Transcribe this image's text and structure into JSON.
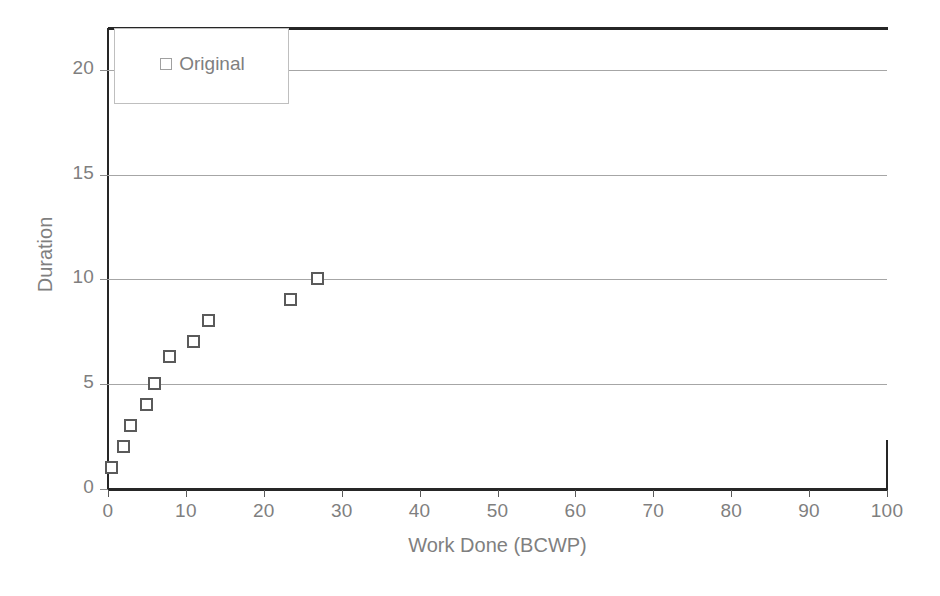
{
  "chart_data": {
    "type": "scatter",
    "title": "",
    "xlabel": "Work Done (BCWP)",
    "ylabel": "Duration",
    "xlim": [
      0,
      100
    ],
    "ylim": [
      0,
      22
    ],
    "xticks": [
      0,
      10,
      20,
      30,
      40,
      50,
      60,
      70,
      80,
      90,
      100
    ],
    "yticks": [
      0,
      5,
      10,
      15,
      20
    ],
    "grid": "horizontal",
    "legend_position": "top-left",
    "series": [
      {
        "name": "Original",
        "marker": "open-square",
        "marker_color": "#5a5a5a",
        "points": [
          {
            "x": 0.5,
            "y": 1
          },
          {
            "x": 2,
            "y": 2
          },
          {
            "x": 3,
            "y": 3
          },
          {
            "x": 5,
            "y": 4
          },
          {
            "x": 6,
            "y": 5
          },
          {
            "x": 8,
            "y": 6.3
          },
          {
            "x": 11,
            "y": 7
          },
          {
            "x": 13,
            "y": 8
          },
          {
            "x": 23.5,
            "y": 9
          },
          {
            "x": 27,
            "y": 10
          }
        ]
      }
    ]
  },
  "axes": {
    "x_title": "Work Done (BCWP)",
    "y_title": "Duration",
    "x_tick_labels": [
      "0",
      "10",
      "20",
      "30",
      "40",
      "50",
      "60",
      "70",
      "80",
      "90",
      "100"
    ],
    "y_tick_labels": [
      "0",
      "5",
      "10",
      "15",
      "20"
    ]
  },
  "legend": {
    "entries": [
      {
        "label": "Original",
        "marker": "open-square-icon"
      }
    ]
  },
  "colors": {
    "marker_stroke": "#5a5a5a",
    "gridline": "#a6a6a6",
    "axis": "#262626",
    "text": "#7f7f7f",
    "background": "#ffffff"
  }
}
